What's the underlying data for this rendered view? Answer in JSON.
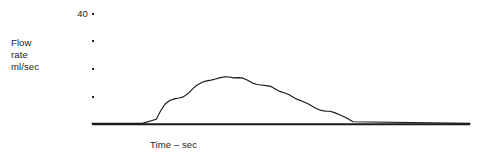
{
  "chart_data": {
    "type": "line",
    "title": "",
    "subtitle": "",
    "xlabel": "Time – sec",
    "ylabel": "Flow rate ml/sec",
    "ylabel_lines": [
      "Flow",
      "rate",
      "ml/sec"
    ],
    "grid": false,
    "legend": "none",
    "series_name": "urine flow rate",
    "axis_color": "#1a1a1a",
    "line_color": "#1a1a1a",
    "ylim": [
      0,
      40
    ],
    "xlim": [
      0,
      60
    ],
    "yticks": [
      40,
      30,
      20,
      10
    ],
    "ytick_labels": [
      "40",
      "",
      "",
      ""
    ],
    "xticks": [],
    "xtick_labels": [],
    "annotations": [],
    "x": [
      0,
      8,
      10.2,
      10.9,
      11.6,
      12.4,
      13.1,
      13.8,
      14.5,
      15.3,
      16.0,
      16.7,
      17.5,
      18.2,
      18.9,
      19.6,
      20.4,
      21.1,
      21.8,
      22.5,
      23.3,
      24.0,
      24.7,
      25.5,
      26.2,
      26.9,
      27.6,
      28.4,
      29.1,
      29.8,
      30.5,
      31.3,
      32.0,
      32.7,
      33.4,
      34.2,
      34.9,
      35.6,
      36.4,
      37.1,
      37.8,
      38.5,
      39.3,
      40.0,
      40.7,
      41.4,
      60.0
    ],
    "y": [
      0,
      0,
      1.5,
      4.6,
      7.0,
      8.4,
      8.9,
      9.2,
      9.6,
      10.9,
      12.6,
      13.9,
      14.9,
      15.4,
      15.7,
      16.1,
      16.6,
      16.9,
      16.8,
      16.5,
      16.6,
      16.4,
      15.6,
      14.6,
      14.1,
      13.9,
      13.7,
      13.4,
      12.5,
      11.6,
      11.1,
      10.4,
      9.4,
      8.6,
      8.0,
      7.2,
      6.3,
      5.4,
      4.7,
      4.4,
      4.4,
      3.9,
      3.1,
      2.4,
      1.6,
      0.6,
      0
    ]
  },
  "axes": {
    "y_tick_dots": [
      {
        "label": "40",
        "top": 13
      },
      {
        "label": "",
        "top": 40
      },
      {
        "label": "",
        "top": 68
      },
      {
        "label": "",
        "top": 96
      }
    ],
    "baseline_label": "x-axis baseline"
  }
}
